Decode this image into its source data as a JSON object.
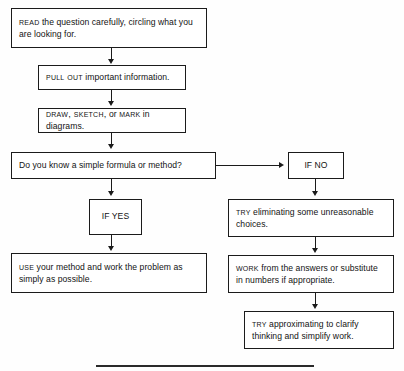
{
  "diagram": {
    "background_color": "#fefefe",
    "line_color": "#1b1b1b",
    "nodes": [
      {
        "id": "read",
        "lead": "READ",
        "rest": " the question carefully, circling what you are looking for.",
        "align": "left"
      },
      {
        "id": "pull-out",
        "lead": "PULL OUT",
        "rest": " important information.",
        "align": "left"
      },
      {
        "id": "draw-sketch-mark",
        "lead": "DRAW, SKETCH,",
        "mid": " or ",
        "lead2": "MARK",
        "rest": " in diagrams.",
        "align": "left"
      },
      {
        "id": "decision",
        "lead": "",
        "rest": "Do you know a simple formula or method?",
        "align": "left"
      },
      {
        "id": "if-yes",
        "lead": "",
        "rest": "IF YES",
        "align": "center"
      },
      {
        "id": "if-no",
        "lead": "",
        "rest": "IF NO",
        "align": "center"
      },
      {
        "id": "use-method",
        "lead": "USE",
        "rest": " your method and work the problem as simply as possible.",
        "align": "left"
      },
      {
        "id": "try-eliminating",
        "lead": "TRY",
        "rest": " eliminating some unreasonable choices.",
        "align": "left"
      },
      {
        "id": "work-answers",
        "lead": "WORK",
        "rest": " from the answers or substitute in numbers if appropriate.",
        "align": "left"
      },
      {
        "id": "try-approximating",
        "lead": "TRY",
        "rest": " approximating to clarify thinking and simplify work.",
        "align": "left"
      }
    ]
  }
}
